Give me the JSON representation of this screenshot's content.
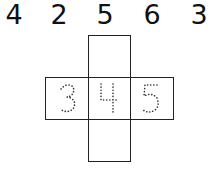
{
  "number_row": [
    "4",
    "2",
    "5",
    "6",
    "3"
  ],
  "net": {
    "cells": [
      {
        "position": "top",
        "label": ""
      },
      {
        "position": "left",
        "label": "3"
      },
      {
        "position": "center",
        "label": "4"
      },
      {
        "position": "right",
        "label": "5"
      },
      {
        "position": "bottom",
        "label": ""
      }
    ]
  }
}
